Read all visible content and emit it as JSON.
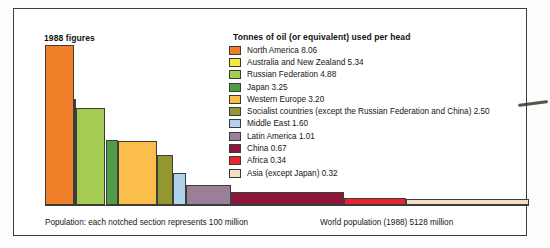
{
  "chart_title": "1988 figures",
  "legend": {
    "title": "Tonnes of oil (or equivalent) used per head",
    "entries": [
      {
        "label": "North America 8.06",
        "color": "#ef7f28"
      },
      {
        "label": "Australia and New Zealand 5.34",
        "color": "#f6ea3c"
      },
      {
        "label": "Russian Federation 4.88",
        "color": "#a5cc52"
      },
      {
        "label": "Japan 3.25",
        "color": "#4fa martial"
      },
      {
        "label": "Western Europe 3.20",
        "color": "#fbbe4a"
      },
      {
        "label": "Socialist countries (except the Russian Federation and China) 2.50",
        "color": "#94962f"
      },
      {
        "label": "Middle East 1.60",
        "color": "#aed3ea"
      },
      {
        "label": "Latin America 1.01",
        "color": "#9b7f98"
      },
      {
        "label": "China 0.67",
        "color": "#8e1638"
      },
      {
        "label": "Africa 0.34",
        "color": "#e8252f"
      },
      {
        "label": "Asia (except Japan) 0.32",
        "color": "#f2ddc6"
      }
    ]
  },
  "captions": {
    "left": "Population: each notched section represents 100 million",
    "right": "World population (1988) 5128 million"
  },
  "chart_data": {
    "type": "bar",
    "variant": "variable-width-marimekko",
    "title": "1988 figures",
    "subtitle": "Tonnes of oil (or equivalent) used per head",
    "xlabel": "Population: each notched section represents 100 million",
    "ylabel": "Tonnes of oil (or equivalent) used per head",
    "ylim": [
      0,
      8.06
    ],
    "grid": false,
    "legend_position": "top-right",
    "notch_unit_million": 100,
    "world_population_million": 5128,
    "year": 1988,
    "categories": [
      "North America",
      "Australia and New Zealand",
      "Russian Federation",
      "Japan",
      "Western Europe",
      "Socialist countries (except the Russian Federation and China)",
      "Middle East",
      "Latin America",
      "China",
      "Africa",
      "Asia (except Japan)"
    ],
    "values": [
      8.06,
      5.34,
      4.88,
      3.25,
      3.2,
      2.5,
      1.6,
      1.01,
      0.67,
      0.34,
      0.32
    ],
    "widths_population_million": [
      275,
      20,
      290,
      123,
      380,
      150,
      130,
      430,
      1100,
      600,
      1630
    ],
    "bars": [
      {
        "name": "North America",
        "value": 8.06,
        "color": "#ef7f28",
        "x": 0,
        "w": 28.5
      },
      {
        "name": "Australia and New Zealand",
        "value": 5.34,
        "color": "#f6ea3c",
        "x": 28.5,
        "w": 2.2
      },
      {
        "name": "Russian Federation",
        "value": 4.88,
        "color": "#a5cc52",
        "x": 30.7,
        "w": 29.8
      },
      {
        "name": "Japan",
        "value": 3.25,
        "color": "#4f9d45",
        "x": 60.5,
        "w": 12.7
      },
      {
        "name": "Western Europe",
        "value": 3.2,
        "color": "#fbbe4a",
        "x": 73.2,
        "w": 39.2
      },
      {
        "name": "Socialist countries (except the Russian Federation and China)",
        "value": 2.5,
        "color": "#94962f",
        "x": 112.4,
        "w": 15.5
      },
      {
        "name": "Middle East",
        "value": 1.6,
        "color": "#aed3ea",
        "x": 127.9,
        "w": 13.4
      },
      {
        "name": "Latin America",
        "value": 1.01,
        "color": "#9b7f98",
        "x": 141.3,
        "w": 44.4
      },
      {
        "name": "China",
        "value": 0.67,
        "color": "#8e1638",
        "x": 185.7,
        "w": 113.6
      },
      {
        "name": "Africa",
        "value": 0.34,
        "color": "#e8252f",
        "x": 299.3,
        "w": 62.0
      },
      {
        "name": "Asia (except Japan)",
        "value": 0.32,
        "color": "#f2ddc6",
        "x": 361.3,
        "w": 122.7
      }
    ]
  }
}
